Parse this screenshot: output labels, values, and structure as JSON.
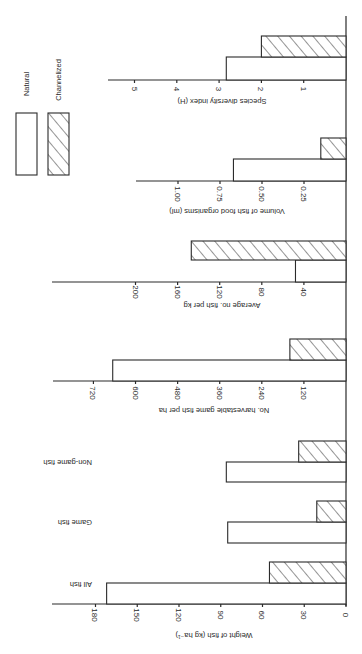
{
  "figure": {
    "orientation": "rotated 90 degrees clockwise (page in landscape)",
    "legend": {
      "items": [
        {
          "key": "natural",
          "label": "Natural",
          "pattern": "open"
        },
        {
          "key": "channelized",
          "label": "Channelized",
          "pattern": "diagonal-hatch"
        }
      ]
    }
  },
  "chart_data": [
    {
      "type": "bar",
      "title": "",
      "ylabel": "Weight of fish (kg ha⁻¹)",
      "xlabel": "",
      "categories": [
        "All fish",
        "Game fish",
        "Non-game fish"
      ],
      "series": [
        {
          "name": "Natural",
          "values": [
            172,
            85,
            86
          ]
        },
        {
          "name": "Channelized",
          "values": [
            55,
            21,
            34
          ]
        }
      ],
      "ylim": [
        0,
        180
      ],
      "ticks": [
        0,
        30,
        60,
        90,
        120,
        150,
        180
      ],
      "tick_labels": [
        "0",
        "30",
        "60",
        "90",
        "120",
        "150",
        "180"
      ]
    },
    {
      "type": "bar",
      "ylabel": "No. harvestable game fish per ha",
      "categories": [
        ""
      ],
      "series": [
        {
          "name": "Natural",
          "values": [
            665
          ]
        },
        {
          "name": "Channelized",
          "values": [
            160
          ]
        }
      ],
      "ylim": [
        0,
        720
      ],
      "ticks": [
        120,
        240,
        360,
        480,
        600,
        720
      ],
      "tick_labels": [
        "120",
        "240",
        "360",
        "480",
        "600",
        "720"
      ]
    },
    {
      "type": "bar",
      "ylabel": "Average no. fish per kg",
      "categories": [
        ""
      ],
      "series": [
        {
          "name": "Natural",
          "values": [
            48
          ]
        },
        {
          "name": "Channelized",
          "values": [
            147
          ]
        }
      ],
      "ylim": [
        0,
        200
      ],
      "ticks": [
        40,
        80,
        120,
        160,
        200
      ],
      "tick_labels": [
        "40",
        "80",
        "120",
        "160",
        "200"
      ]
    },
    {
      "type": "bar",
      "ylabel": "Volume of fish food organisms (ml)",
      "categories": [
        ""
      ],
      "series": [
        {
          "name": "Natural",
          "values": [
            0.67
          ]
        },
        {
          "name": "Channelized",
          "values": [
            0.15
          ]
        }
      ],
      "ylim": [
        0,
        1.0
      ],
      "ticks": [
        0.25,
        0.5,
        0.75,
        1.0
      ],
      "tick_labels": [
        "0.25",
        "0.50",
        "0.75",
        "1.00"
      ]
    },
    {
      "type": "bar",
      "ylabel": "Species diversity index (H)",
      "categories": [
        ""
      ],
      "series": [
        {
          "name": "Natural",
          "values": [
            2.83
          ]
        },
        {
          "name": "Channelized",
          "values": [
            2.0
          ]
        }
      ],
      "ylim": [
        0,
        5
      ],
      "ticks": [
        1,
        2,
        3,
        4,
        5
      ],
      "tick_labels": [
        "1",
        "2",
        "3",
        "4",
        "5"
      ]
    }
  ],
  "layout": {
    "baseline_x": 346,
    "baseline_top": 16,
    "baseline_bottom": 606,
    "panels": [
      {
        "axis_y": 604,
        "axis_start_x": 52,
        "px_per_unit": 1.3917,
        "groups": [
          {
            "label_y": 585,
            "label_right": 92,
            "chan": [
              562,
              583
            ],
            "nat": [
              583,
              604
            ]
          },
          {
            "label_y": 523,
            "label_right": 92,
            "chan": [
              501,
              522
            ],
            "nat": [
              522,
              543
            ]
          },
          {
            "label_y": 463,
            "label_right": 92,
            "chan": [
              441,
              462
            ],
            "nat": [
              462,
              482
            ]
          }
        ],
        "tick_label_y": 615,
        "title_y": 636,
        "title_cx": 214
      },
      {
        "axis_y": 381,
        "axis_start_x": 53,
        "px_per_unit": 0.3508,
        "groups": [
          {
            "chan": [
              339,
              360
            ],
            "nat": [
              360,
              381
            ]
          }
        ],
        "tick_label_y": 393,
        "title_y": 411,
        "title_cx": 214
      },
      {
        "axis_y": 282,
        "axis_start_x": 52,
        "px_per_unit": 1.0525,
        "groups": [
          {
            "chan": [
              241,
              260
            ],
            "nat": [
              260,
              282
            ]
          }
        ],
        "tick_label_y": 292,
        "title_y": 306,
        "title_cx": 222
      },
      {
        "axis_y": 181,
        "axis_start_x": 136,
        "px_per_unit": 168,
        "groups": [
          {
            "chan": [
              138,
              159
            ],
            "nat": [
              159,
              181
            ]
          }
        ],
        "tick_label_y": 194,
        "title_y": 212,
        "title_cx": 227
      },
      {
        "axis_y": 80,
        "axis_start_x": 108,
        "px_per_unit": 42.3,
        "groups": [
          {
            "chan": [
              36,
              57
            ],
            "nat": [
              57,
              80
            ]
          }
        ],
        "tick_label_y": 89,
        "title_y": 102,
        "title_cx": 222
      }
    ],
    "legend": {
      "natural_box": [
        16,
        113,
        21,
        62
      ],
      "channel_box": [
        48,
        113,
        21,
        62
      ],
      "natural_label_pos": [
        26,
        84
      ],
      "channel_label_pos": [
        58,
        80
      ]
    }
  }
}
